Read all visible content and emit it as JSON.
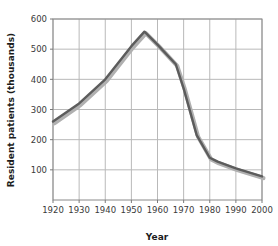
{
  "chart_data": {
    "type": "line",
    "title": "",
    "xlabel": "Year",
    "ylabel": "Resident patients (thousands)",
    "xlim": [
      1920,
      2000
    ],
    "ylim": [
      0,
      600
    ],
    "grid": true,
    "legend": null,
    "xticks": [
      1920,
      1930,
      1940,
      1950,
      1960,
      1970,
      1980,
      1990,
      2000
    ],
    "xtick_labels": [
      "1920",
      "1930",
      "1940",
      "1950",
      "1960",
      "1970",
      "1980",
      "1990",
      "2000"
    ],
    "yticks": [
      100,
      200,
      300,
      400,
      500,
      600
    ],
    "ytick_labels": [
      "100",
      "200",
      "300",
      "400",
      "500",
      "600"
    ],
    "series": [
      {
        "name": "Resident patients",
        "color": "#5c5c5c",
        "shadow_color": "#b0b0b0",
        "x": [
          1920,
          1930,
          1940,
          1950,
          1955,
          1960,
          1967,
          1970,
          1975,
          1980,
          1983,
          1990,
          2000
        ],
        "values": [
          260,
          320,
          400,
          510,
          558,
          515,
          450,
          370,
          215,
          140,
          127,
          105,
          78
        ]
      }
    ]
  },
  "axis": {
    "x_title": "Year",
    "y_title": "Resident patients (thousands)"
  },
  "style": {
    "line_color": "#5c5c5c",
    "shadow_color": "#b3b3b3",
    "grid_color": "#b9b9b9",
    "axis_color": "#7a7a7a",
    "text_color": "#2e2e2e",
    "background": "#ffffff"
  }
}
